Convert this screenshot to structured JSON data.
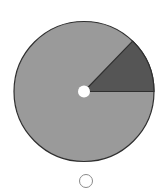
{
  "diagram": {
    "type": "pie-wedge",
    "center": [
      84,
      91.5
    ],
    "radius": 70,
    "hole_radius": 6,
    "wedge_start_deg": 0,
    "wedge_end_deg": 46,
    "colors": {
      "base": "#9a9a9a",
      "wedge": "#555555",
      "outline": "#2f2f2f",
      "hole": "#ffffff"
    }
  },
  "radio": {
    "center": [
      86,
      181
    ],
    "radius": 6.5,
    "selected": false,
    "stroke": "#8a8a8a"
  }
}
